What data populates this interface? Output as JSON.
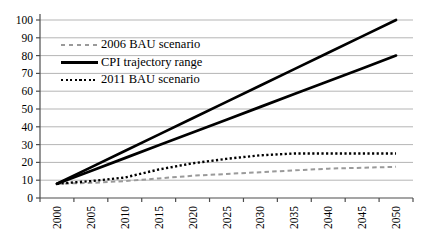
{
  "chart_data": {
    "type": "line",
    "title": "",
    "xlabel": "",
    "ylabel": "",
    "categories": [
      "2000",
      "2005",
      "2010",
      "2015",
      "2020",
      "2025",
      "2030",
      "2035",
      "2040",
      "2045",
      "2050"
    ],
    "ylim": [
      0,
      100
    ],
    "yticks": [
      0,
      10,
      20,
      30,
      40,
      50,
      60,
      70,
      80,
      90,
      100
    ],
    "grid": "horizontal",
    "legend_position": "top-left",
    "colors": {
      "grid": "#b5b5b5",
      "axis": "#4d4d4d",
      "bau2006": "#9a9a9a",
      "cpi": "#000000",
      "bau2011": "#000000"
    },
    "series": [
      {
        "name": "2006 BAU scenario",
        "style": "dashed",
        "color": "#9a9a9a",
        "width": 2,
        "lines": [
          [
            8,
            8.5,
            9.5,
            11,
            12.5,
            13.5,
            14.5,
            15.5,
            16.5,
            17,
            17.5
          ]
        ]
      },
      {
        "name": "CPI trajectory range",
        "style": "solid",
        "color": "#000000",
        "width": 2.7,
        "lines": [
          [
            8,
            17.2,
            26.4,
            35.6,
            44.8,
            54,
            63.2,
            72.4,
            81.6,
            90.8,
            100
          ],
          [
            8,
            15.2,
            22.4,
            29.6,
            36.8,
            44,
            51.2,
            58.4,
            65.6,
            72.8,
            80
          ]
        ]
      },
      {
        "name": "2011 BAU scenario",
        "style": "dotted",
        "color": "#000000",
        "width": 2.4,
        "lines": [
          [
            8,
            9.5,
            11.5,
            16,
            19.5,
            22,
            24,
            25,
            25,
            25,
            25
          ]
        ]
      }
    ]
  }
}
